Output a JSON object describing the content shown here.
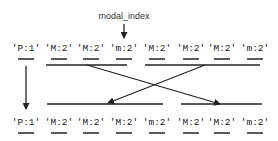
{
  "pointer_label": "modal_index",
  "pointer_target_index": 3,
  "top_row": [
    "'P:1'",
    "'M:2'",
    "'M:2'",
    "'m:2'",
    "'M:2'",
    "'M:2'",
    "'M:2'",
    "'m:2'"
  ],
  "bottom_row": [
    "'P:1'",
    "'M:2'",
    "'M:2'",
    "'M:2'",
    "'m:2'",
    "'M:2'",
    "'M:2'",
    "'m:2'"
  ],
  "top_groups": [
    {
      "name": "left-segment",
      "from": 1,
      "to": 3
    },
    {
      "name": "right-segment",
      "from": 4,
      "to": 7
    }
  ],
  "bottom_groups": [
    {
      "name": "left-segment",
      "from": 1,
      "to": 4
    },
    {
      "name": "right-segment",
      "from": 5,
      "to": 7
    }
  ],
  "colors": {
    "ink": "#222222",
    "background": "#ffffff"
  }
}
